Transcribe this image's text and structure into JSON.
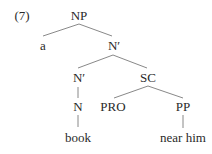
{
  "example_number": "(7)",
  "tree": {
    "nodes": {
      "np": "NP",
      "a": "a",
      "nbar_top": "N′",
      "nbar_low": "N′",
      "sc": "SC",
      "n": "N",
      "pro": "PRO",
      "pp": "PP",
      "book": "book",
      "near_him": "near him"
    },
    "edges": [
      [
        "NP",
        "a"
      ],
      [
        "NP",
        "N′"
      ],
      [
        "N′",
        "N′"
      ],
      [
        "N′",
        "SC"
      ],
      [
        "N′",
        "N"
      ],
      [
        "N",
        "book"
      ],
      [
        "SC",
        "PRO"
      ],
      [
        "SC",
        "PP"
      ],
      [
        "PP",
        "near him"
      ]
    ]
  }
}
